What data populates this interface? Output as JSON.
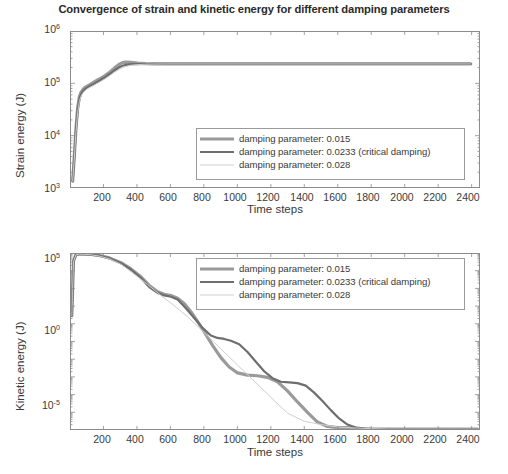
{
  "figure": {
    "title": "Convergence of strain and kinetic energy for different damping parameters",
    "background": "#ffffff",
    "axis_color": "#8c8c8c"
  },
  "series_style": {
    "s1_color": "#9a9a9a",
    "s1_width": "3.2",
    "s2_color": "#6e6e6e",
    "s2_width": "2.2",
    "s3_color": "#cfcfcf",
    "s3_width": "1.0"
  },
  "legend": {
    "entries": [
      "damping parameter: 0.015",
      "damping parameter: 0.0233 (critical damping)",
      "damping parameter: 0.028"
    ]
  },
  "chart_data": [
    {
      "type": "line",
      "id": "strain-energy",
      "title": "Convergence of strain and kinetic energy for different damping parameters",
      "xlabel": "Time steps",
      "ylabel": "Strain energy (J)",
      "yscale": "log",
      "ylim": [
        1000,
        1000000
      ],
      "xlim": [
        0,
        2450
      ],
      "grid": false,
      "legend_position": "lower right",
      "yticks": [
        1000,
        10000,
        100000,
        1000000
      ],
      "ytick_labels": [
        "10",
        "10",
        "10",
        "10"
      ],
      "ytick_exponents": [
        "3",
        "4",
        "5",
        "6"
      ],
      "xticks": [
        200,
        400,
        600,
        800,
        1000,
        1200,
        1400,
        1600,
        1800,
        2000,
        2200,
        2400
      ],
      "xtick_labels": [
        "200",
        "400",
        "600",
        "800",
        "1000",
        "1200",
        "1400",
        "1600",
        "1800",
        "2000",
        "2200",
        "2400"
      ],
      "series": [
        {
          "name": "damping parameter: 0.015",
          "x": [
            10,
            20,
            30,
            40,
            50,
            60,
            70,
            80,
            90,
            100,
            120,
            140,
            160,
            180,
            200,
            230,
            260,
            290,
            310,
            330,
            360,
            400,
            450,
            500,
            560,
            620,
            700,
            800,
            900,
            1000,
            1200,
            1400,
            1600,
            1800,
            2000,
            2200,
            2400
          ],
          "y": [
            1300,
            4000,
            14000,
            34000,
            55000,
            68000,
            76000,
            82000,
            87000,
            91000,
            99000,
            108000,
            118000,
            128000,
            140000,
            165000,
            200000,
            238000,
            255000,
            262000,
            258000,
            249000,
            244000,
            242000,
            241500,
            241000,
            241000,
            241000,
            241000,
            241000,
            241000,
            241000,
            241000,
            241000,
            241000,
            241000,
            241000
          ]
        },
        {
          "name": "damping parameter: 0.0233 (critical damping)",
          "x": [
            10,
            20,
            30,
            40,
            50,
            60,
            70,
            80,
            90,
            100,
            120,
            140,
            160,
            180,
            200,
            230,
            260,
            290,
            310,
            330,
            360,
            400,
            450,
            500,
            560,
            620,
            700,
            800,
            900,
            1000,
            1200,
            1400,
            1600,
            1800,
            2000,
            2200,
            2400
          ],
          "y": [
            1300,
            3800,
            13000,
            31000,
            50000,
            62000,
            70000,
            76000,
            81000,
            85000,
            92000,
            100000,
            109000,
            119000,
            130000,
            152000,
            180000,
            208000,
            222000,
            232000,
            238000,
            240000,
            240500,
            240800,
            241000,
            241000,
            241000,
            241000,
            241000,
            241000,
            241000,
            241000,
            241000,
            241000,
            241000,
            241000,
            241000
          ]
        },
        {
          "name": "damping parameter: 0.028",
          "x": [
            10,
            20,
            30,
            40,
            50,
            60,
            70,
            80,
            90,
            100,
            120,
            140,
            160,
            180,
            200,
            230,
            260,
            290,
            310,
            330,
            360,
            400,
            450,
            500,
            560,
            620,
            700,
            800,
            900,
            1000,
            1200,
            1400,
            1600,
            1800,
            2000,
            2200,
            2400
          ],
          "y": [
            1300,
            3600,
            12000,
            28000,
            45000,
            57000,
            65000,
            71000,
            76000,
            80000,
            87000,
            94000,
            102000,
            111000,
            121000,
            141000,
            165000,
            190000,
            204000,
            215000,
            227000,
            234000,
            238000,
            239500,
            240500,
            241000,
            241000,
            241000,
            241000,
            241000,
            241000,
            241000,
            241000,
            241000,
            241000,
            241000,
            241000
          ]
        }
      ]
    },
    {
      "type": "line",
      "id": "kinetic-energy",
      "title": "",
      "xlabel": "Time steps",
      "ylabel": "Kinetic energy (J)",
      "yscale": "log",
      "ylim": [
        1e-05,
        100000
      ],
      "xlim": [
        0,
        2450
      ],
      "grid": false,
      "legend_position": "upper right",
      "yticks": [
        1e-05,
        1,
        100000
      ],
      "ytick_labels": [
        "10",
        "10",
        "10"
      ],
      "ytick_exponents": [
        "-5",
        "0",
        "5"
      ],
      "xticks": [
        200,
        400,
        600,
        800,
        1000,
        1200,
        1400,
        1600,
        1800,
        2000,
        2200,
        2400
      ],
      "xtick_labels": [
        "200",
        "400",
        "600",
        "800",
        "1000",
        "1200",
        "1400",
        "1600",
        "1800",
        "2000",
        "2200",
        "2400"
      ],
      "series": [
        {
          "name": "damping parameter: 0.015",
          "x": [
            5,
            15,
            30,
            50,
            80,
            120,
            170,
            230,
            300,
            360,
            420,
            470,
            520,
            560,
            600,
            640,
            680,
            720,
            760,
            800,
            850,
            900,
            950,
            1000,
            1060,
            1120,
            1180,
            1240,
            1300,
            1360,
            1420,
            1480,
            1540,
            1600,
            1660,
            1720,
            1780,
            1850,
            1950,
            2050,
            2150,
            2250,
            2350,
            2440
          ],
          "y": [
            30,
            40000,
            95000,
            100000,
            99000,
            95000,
            82000,
            60000,
            32000,
            14000,
            5000,
            1600,
            700,
            500,
            420,
            300,
            150,
            50,
            14,
            3.5,
            0.6,
            0.12,
            0.035,
            0.016,
            0.012,
            0.011,
            0.009,
            0.005,
            0.0015,
            0.00035,
            9e-05,
            2.5e-05,
            1.4e-05,
            1.2e-05,
            1.2e-05,
            1.1e-05,
            1e-05,
            1e-05,
            1e-05,
            1e-05,
            1e-05,
            1e-05,
            1e-05,
            1e-05
          ]
        },
        {
          "name": "damping parameter: 0.0233 (critical damping)",
          "x": [
            5,
            15,
            30,
            50,
            80,
            120,
            170,
            230,
            300,
            360,
            420,
            470,
            520,
            560,
            600,
            640,
            690,
            740,
            790,
            840,
            880,
            920,
            960,
            1010,
            1060,
            1110,
            1160,
            1210,
            1260,
            1310,
            1360,
            1410,
            1460,
            1510,
            1560,
            1610,
            1660,
            1710,
            1760,
            1820,
            1900,
            2000,
            2100,
            2200,
            2300,
            2440
          ],
          "y": [
            30,
            38000,
            92000,
            99000,
            98000,
            93000,
            80000,
            58000,
            30000,
            13000,
            4200,
            1300,
            600,
            430,
            360,
            250,
            80,
            22,
            6,
            2.2,
            1.6,
            1.4,
            1.1,
            0.7,
            0.25,
            0.07,
            0.02,
            0.008,
            0.005,
            0.0046,
            0.0042,
            0.003,
            0.0012,
            0.0004,
            0.00012,
            4e-05,
            1.8e-05,
            1.2e-05,
            1.05e-05,
            1e-05,
            1e-05,
            1e-05,
            1e-05,
            1e-05,
            1e-05,
            1e-05
          ]
        },
        {
          "name": "damping parameter: 0.028",
          "x": [
            5,
            15,
            30,
            50,
            80,
            120,
            170,
            230,
            300,
            380,
            460,
            540,
            620,
            700,
            800,
            900,
            1000,
            1100,
            1200,
            1300,
            1400,
            1500,
            1600,
            1700,
            1800,
            1900,
            1980,
            2050,
            2150,
            2250,
            2350,
            2440
          ],
          "y": [
            30,
            36000,
            90000,
            98000,
            96000,
            90000,
            76000,
            53000,
            26000,
            7000,
            1800,
            430,
            110,
            26,
            3.2,
            0.38,
            0.045,
            0.0055,
            0.00065,
            8e-05,
            2.8e-05,
            1.8e-05,
            1.3e-05,
            1.15e-05,
            1.05e-05,
            1e-05,
            1e-05,
            1e-05,
            1e-05,
            1e-05,
            1e-05,
            1e-05
          ]
        }
      ]
    }
  ]
}
